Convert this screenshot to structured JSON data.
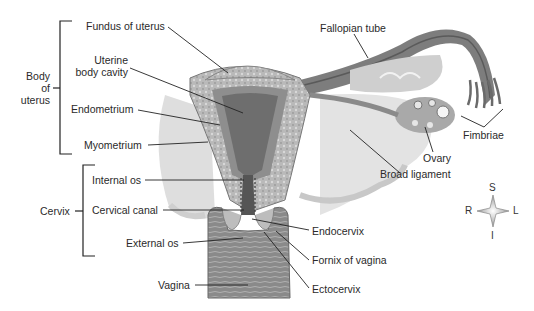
{
  "figure": {
    "background": "#ffffff",
    "line_color": "#222222"
  },
  "groups": {
    "body_of_uterus": {
      "line1": "Body",
      "line2": "of",
      "line3": "uterus"
    },
    "cervix": {
      "label": "Cervix"
    }
  },
  "labels": {
    "fundus": "Fundus of uterus",
    "uterine_cavity_1": "Uterine",
    "uterine_cavity_2": "body cavity",
    "endometrium": "Endometrium",
    "myometrium": "Myometrium",
    "internal_os": "Internal os",
    "cervical_canal": "Cervical canal",
    "external_os": "External os",
    "vagina": "Vagina",
    "fallopian_tube": "Fallopian tube",
    "fimbriae": "Fimbriae",
    "ovary": "Ovary",
    "broad_ligament": "Broad ligament",
    "endocervix": "Endocervix",
    "fornix": "Fornix of vagina",
    "ectocervix": "Ectocervix"
  },
  "compass": {
    "superior": "S",
    "inferior": "I",
    "right": "R",
    "left": "L"
  }
}
